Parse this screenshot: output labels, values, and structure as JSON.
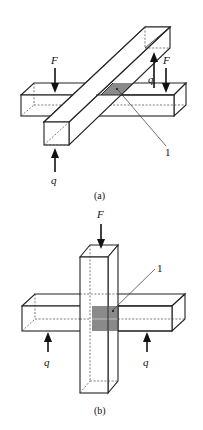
{
  "figure_a": {
    "caption": "(a)",
    "load_labels": {
      "force_left": "F",
      "force_right": "F",
      "reaction_top": "q",
      "reaction_bottom": "q"
    },
    "callout": "1"
  },
  "figure_b": {
    "caption": "(b)",
    "load_labels": {
      "force_top": "F",
      "reaction_left": "q",
      "reaction_right": "q"
    },
    "callout": "1"
  },
  "colors": {
    "line": "#222222",
    "shaded_contact_zone": "#8a8a8a",
    "background": "#ffffff"
  }
}
